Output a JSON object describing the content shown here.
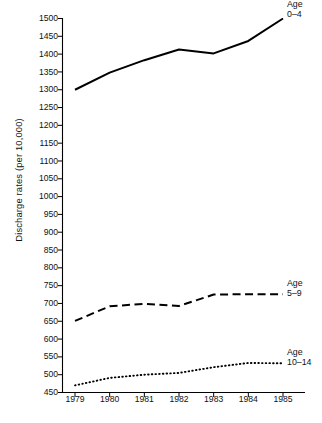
{
  "chart_data": {
    "type": "line",
    "title": "",
    "xlabel": "",
    "ylabel": "Discharge rates (per 10,000)",
    "x": [
      1979,
      1980,
      1981,
      1982,
      1983,
      1984,
      1985
    ],
    "xticklabels": [
      "1979",
      "1980",
      "1981",
      "1982",
      "1983",
      "1984",
      "1985"
    ],
    "xlim": [
      1979,
      1985
    ],
    "ylim": [
      450,
      1500
    ],
    "yticks": [
      450,
      500,
      550,
      600,
      650,
      700,
      750,
      800,
      850,
      900,
      950,
      1000,
      1050,
      1100,
      1150,
      1200,
      1250,
      1300,
      1350,
      1400,
      1450,
      1500
    ],
    "yticklabels": [
      "450",
      "500",
      "550",
      "600",
      "650",
      "700",
      "750",
      "800",
      "850",
      "900",
      "950",
      "1000",
      "1050",
      "1100",
      "1150",
      "1200",
      "1250",
      "1300",
      "1350",
      "1400",
      "1450",
      "1500"
    ],
    "grid": false,
    "legend_position": "right-inline",
    "series": [
      {
        "name": "Age 0–4",
        "label_line1": "Age",
        "label_line2": "0–4",
        "style": "solid",
        "color": "#000000",
        "values": [
          1300,
          1348,
          1383,
          1413,
          1402,
          1437,
          1500
        ]
      },
      {
        "name": "Age 5–9",
        "label_line1": "Age",
        "label_line2": "5–9",
        "style": "dashed",
        "color": "#000000",
        "values": [
          651,
          692,
          699,
          693,
          725,
          726,
          726
        ]
      },
      {
        "name": "Age 10–14",
        "label_line1": "Age",
        "label_line2": "10–14",
        "style": "dotted",
        "color": "#000000",
        "values": [
          470,
          491,
          500,
          505,
          521,
          533,
          532
        ]
      }
    ]
  },
  "axes": {
    "y_axis_title": "Discharge rates (per 10,000)",
    "axis_color": "#000000"
  }
}
